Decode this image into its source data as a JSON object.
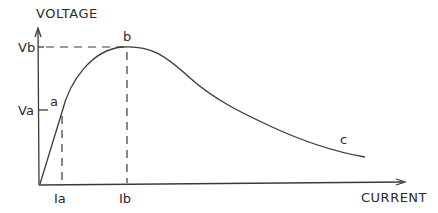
{
  "diagram": {
    "y_axis_label": "VOLTAGE",
    "x_axis_label": "CURRENT",
    "y_ticks": [
      {
        "label": "Vb",
        "y": 47
      },
      {
        "label": "Va",
        "y": 110
      }
    ],
    "x_ticks": [
      {
        "label": "Ia",
        "x": 62
      },
      {
        "label": "Ib",
        "x": 127
      }
    ],
    "points": [
      {
        "label": "a",
        "x": 62,
        "y": 110
      },
      {
        "label": "b",
        "x": 127,
        "y": 47
      },
      {
        "label": "c",
        "x": 343,
        "y": 140
      }
    ],
    "colors": {
      "line": "#3a3a3a",
      "text": "#2a2a2a",
      "background": "#ffffff"
    }
  }
}
